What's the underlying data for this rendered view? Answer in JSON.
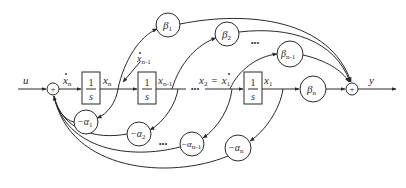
{
  "diagram": {
    "type": "signal-flow block diagram (observable canonical form state-space realization)",
    "input_label": "u",
    "output_label": "y",
    "sum_symbol": "+",
    "integrator": {
      "numerator": "1",
      "denominator": "s"
    },
    "signals": {
      "xn_dot": {
        "base": "x",
        "sub": "n",
        "dot": true
      },
      "xn": {
        "base": "x",
        "sub": "n"
      },
      "xn1_dot": {
        "base": "x",
        "sub": "n-1",
        "dot": true
      },
      "xn1": {
        "base": "x",
        "sub": "n-1"
      },
      "x2": {
        "base": "x",
        "sub": "2"
      },
      "equals": "=",
      "x1_dot": {
        "base": "x",
        "sub": "1",
        "dot": true
      },
      "x1": {
        "base": "x",
        "sub": "1"
      }
    },
    "ellipsis": "•••",
    "beta_gains": [
      {
        "base": "β",
        "sub": "1"
      },
      {
        "base": "β",
        "sub": "2"
      },
      {
        "base": "β",
        "sub": "n-1"
      },
      {
        "base": "β",
        "sub": "n"
      }
    ],
    "alpha_gains": [
      {
        "prefix": "−",
        "base": "α",
        "sub": "1"
      },
      {
        "prefix": "−",
        "base": "α",
        "sub": "2"
      },
      {
        "prefix": "−",
        "base": "α",
        "sub": "n-1"
      },
      {
        "prefix": "−",
        "base": "α",
        "sub": "n"
      }
    ]
  }
}
